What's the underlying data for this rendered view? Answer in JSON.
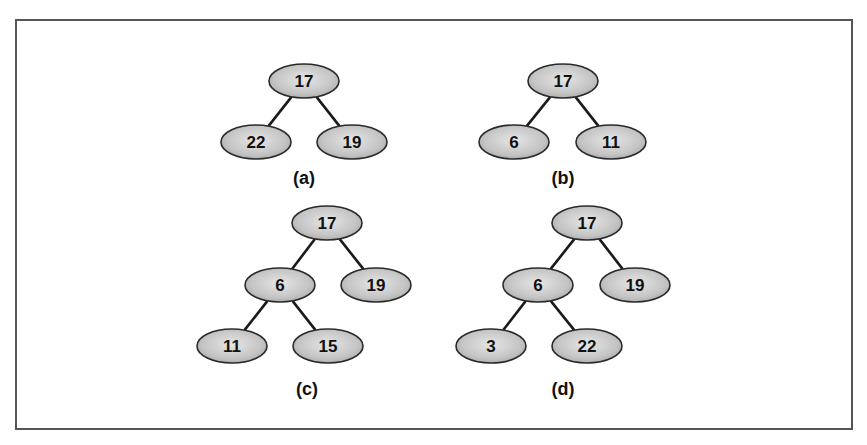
{
  "figure": {
    "node_fill": "#c8c8c8",
    "node_stroke": "#2a2a2a",
    "edge_color": "#1a1a1a",
    "border_color": "#555555"
  },
  "trees": [
    {
      "caption": "(a)",
      "nodes": [
        {
          "id": "a0",
          "label": "17",
          "x": 304,
          "y": 81
        },
        {
          "id": "a1",
          "label": "22",
          "x": 256,
          "y": 142
        },
        {
          "id": "a2",
          "label": "19",
          "x": 352,
          "y": 142
        }
      ],
      "edges": [
        [
          "a0",
          "a1"
        ],
        [
          "a0",
          "a2"
        ]
      ],
      "caption_pos": {
        "x": 304,
        "y": 184
      }
    },
    {
      "caption": "(b)",
      "nodes": [
        {
          "id": "b0",
          "label": "17",
          "x": 563,
          "y": 81
        },
        {
          "id": "b1",
          "label": "6",
          "x": 514,
          "y": 142
        },
        {
          "id": "b2",
          "label": "11",
          "x": 611,
          "y": 142
        }
      ],
      "edges": [
        [
          "b0",
          "b1"
        ],
        [
          "b0",
          "b2"
        ]
      ],
      "caption_pos": {
        "x": 563,
        "y": 184
      }
    },
    {
      "caption": "(c)",
      "nodes": [
        {
          "id": "c0",
          "label": "17",
          "x": 327,
          "y": 223
        },
        {
          "id": "c1",
          "label": "6",
          "x": 280,
          "y": 285
        },
        {
          "id": "c2",
          "label": "19",
          "x": 376,
          "y": 285
        },
        {
          "id": "c3",
          "label": "11",
          "x": 232,
          "y": 346
        },
        {
          "id": "c4",
          "label": "15",
          "x": 328,
          "y": 346
        }
      ],
      "edges": [
        [
          "c0",
          "c1"
        ],
        [
          "c0",
          "c2"
        ],
        [
          "c1",
          "c3"
        ],
        [
          "c1",
          "c4"
        ]
      ],
      "caption_pos": {
        "x": 307,
        "y": 395
      }
    },
    {
      "caption": "(d)",
      "nodes": [
        {
          "id": "d0",
          "label": "17",
          "x": 587,
          "y": 223
        },
        {
          "id": "d1",
          "label": "6",
          "x": 538,
          "y": 285
        },
        {
          "id": "d2",
          "label": "19",
          "x": 635,
          "y": 285
        },
        {
          "id": "d3",
          "label": "3",
          "x": 491,
          "y": 346
        },
        {
          "id": "d4",
          "label": "22",
          "x": 587,
          "y": 346
        }
      ],
      "edges": [
        [
          "d0",
          "d1"
        ],
        [
          "d0",
          "d2"
        ],
        [
          "d1",
          "d3"
        ],
        [
          "d1",
          "d4"
        ]
      ],
      "caption_pos": {
        "x": 563,
        "y": 395
      }
    }
  ]
}
